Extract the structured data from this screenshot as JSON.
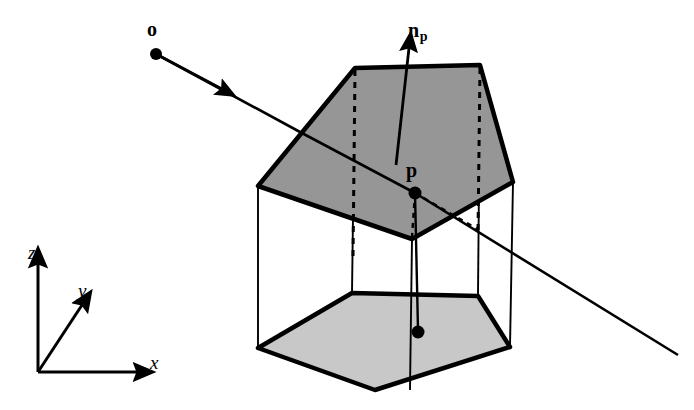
{
  "figure": {
    "background_color": "#ffffff",
    "stroke_color": "#000000",
    "width": 694,
    "height": 410
  },
  "labels": {
    "origin": "o",
    "normal": "n",
    "normal_subscript": "p",
    "point": "p",
    "axis_z": "z",
    "axis_y": "y",
    "axis_x": "x"
  },
  "colors": {
    "top_face_gray": "#969696",
    "bottom_face_gray": "#c8c8c8",
    "line": "#000000",
    "background": "#ffffff"
  },
  "geometry": {
    "top_pentagon": [
      [
        258,
        186
      ],
      [
        355,
        68
      ],
      [
        480,
        65
      ],
      [
        513,
        182
      ],
      [
        412,
        239
      ]
    ],
    "bottom_pentagon": [
      [
        258,
        348
      ],
      [
        375,
        390
      ],
      [
        510,
        347
      ],
      [
        478,
        296
      ],
      [
        352,
        293
      ]
    ],
    "vertical_edges": [
      [
        [
          258,
          186
        ],
        [
          258,
          348
        ]
      ],
      [
        [
          355,
          68
        ],
        [
          352,
          293
        ]
      ],
      [
        [
          480,
          65
        ],
        [
          478,
          296
        ]
      ],
      [
        [
          513,
          182
        ],
        [
          510,
          347
        ]
      ],
      [
        [
          412,
          239
        ],
        [
          410,
          390
        ]
      ]
    ],
    "dashed_lines": [
      [
        [
          355,
          68
        ],
        [
          352,
          293
        ]
      ],
      [
        [
          480,
          65
        ],
        [
          478,
          296
        ]
      ],
      [
        [
          415,
          193
        ],
        [
          412,
          239
        ]
      ],
      [
        [
          415,
          193
        ],
        [
          478,
          229
        ]
      ]
    ],
    "ray": {
      "origin": [
        156,
        54
      ],
      "through_point": [
        415,
        193
      ],
      "exit": [
        678,
        355
      ],
      "arrowhead_at": [
        216,
        85
      ]
    },
    "normal_vector": {
      "base": [
        396,
        165
      ],
      "tip": [
        408,
        45
      ]
    },
    "projection": {
      "from": [
        415,
        193
      ],
      "to": [
        418,
        332
      ]
    },
    "axes": {
      "origin": [
        38,
        372
      ],
      "z_tip": [
        38,
        258
      ],
      "y_tip": [
        78,
        300
      ],
      "x_tip": [
        143,
        372
      ]
    }
  }
}
